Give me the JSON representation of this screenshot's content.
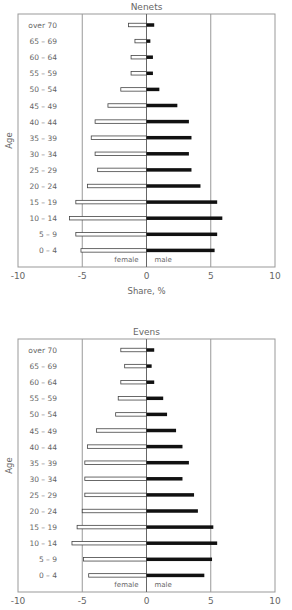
{
  "chart_data": [
    {
      "type": "bar",
      "orientation": "horizontal",
      "subtype": "population-pyramid",
      "title": "Nenets",
      "xlabel": "Share, %",
      "ylabel": "Age",
      "xlim": [
        -10,
        10
      ],
      "xticks": [
        "-10",
        "-5",
        "0",
        "5",
        "10"
      ],
      "grid": {
        "vertical_lines_at": [
          -5,
          0,
          5
        ]
      },
      "annotations": {
        "left_of_zero": "female",
        "right_of_zero": "male"
      },
      "categories": [
        "over 70",
        "65 – 69",
        "60 – 64",
        "55 – 59",
        "50 – 54",
        "45 – 49",
        "40 – 44",
        "35 – 39",
        "30 – 34",
        "25 – 29",
        "20 – 24",
        "15 – 19",
        "10 – 14",
        "5 – 9",
        "0 – 4"
      ],
      "series": [
        {
          "name": "female",
          "style": "outlined",
          "color": "#ffffff",
          "stroke": "#444444",
          "values": [
            -1.4,
            -0.9,
            -1.2,
            -1.2,
            -2.0,
            -3.0,
            -4.0,
            -4.3,
            -4.0,
            -3.8,
            -4.6,
            -5.5,
            -6.0,
            -5.5,
            -5.1
          ]
        },
        {
          "name": "male",
          "style": "filled",
          "color": "#111111",
          "values": [
            0.6,
            0.3,
            0.5,
            0.5,
            1.0,
            2.4,
            3.3,
            3.5,
            3.3,
            3.5,
            4.2,
            5.5,
            5.9,
            5.5,
            5.3
          ]
        }
      ]
    },
    {
      "type": "bar",
      "orientation": "horizontal",
      "subtype": "population-pyramid",
      "title": "Evens",
      "xlabel": "",
      "ylabel": "Age",
      "xlim": [
        -10,
        10
      ],
      "xticks": [
        "-10",
        "-5",
        "0",
        "5",
        "10"
      ],
      "grid": {
        "vertical_lines_at": [
          -5,
          0,
          5
        ]
      },
      "annotations": {
        "left_of_zero": "female",
        "right_of_zero": "male"
      },
      "categories": [
        "over 70",
        "65 – 69",
        "60 – 64",
        "55 – 59",
        "50 – 54",
        "45 – 49",
        "40 – 44",
        "35 – 39",
        "30 – 34",
        "25 – 29",
        "20 – 24",
        "15 – 19",
        "10 – 14",
        "5 – 9",
        "0 – 4"
      ],
      "series": [
        {
          "name": "female",
          "style": "outlined",
          "color": "#ffffff",
          "stroke": "#444444",
          "values": [
            -2.0,
            -1.7,
            -2.0,
            -2.2,
            -2.4,
            -3.9,
            -4.6,
            -4.8,
            -4.8,
            -4.8,
            -5.0,
            -5.4,
            -5.8,
            -4.9,
            -4.5
          ]
        },
        {
          "name": "male",
          "style": "filled",
          "color": "#111111",
          "values": [
            0.6,
            0.4,
            0.6,
            1.3,
            1.6,
            2.3,
            2.8,
            3.3,
            2.8,
            3.7,
            4.0,
            5.2,
            5.5,
            5.1,
            4.5
          ]
        }
      ]
    }
  ]
}
